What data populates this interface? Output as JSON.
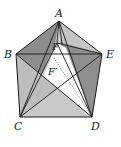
{
  "diagram": {
    "labels": {
      "A": "A",
      "B": "B",
      "C": "C",
      "D": "D",
      "E": "E",
      "F": "F",
      "F_prime": "F′"
    },
    "points": {
      "A": [
        59,
        21
      ],
      "B": [
        16,
        54
      ],
      "E": [
        102,
        54
      ],
      "C": [
        20,
        117
      ],
      "D": [
        92,
        117
      ],
      "F": [
        57,
        43
      ]
    },
    "colors": {
      "stroke": "#1a1a1a",
      "dark_fill": "#8f8f8f",
      "mid_fill": "#b5b5b5",
      "light_fill": "#d4d4d4",
      "white_fill": "#ffffff"
    }
  }
}
